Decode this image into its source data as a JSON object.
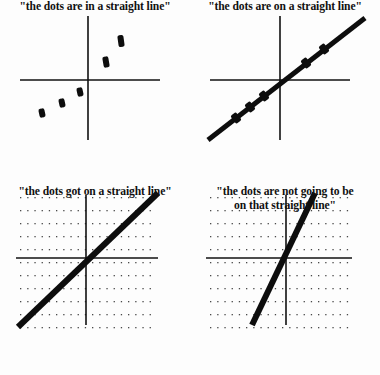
{
  "meme": {
    "title": "the dots are in a straight line",
    "background_color": "#fdfdfd",
    "ink_color": "#111111",
    "panel_count": 4
  },
  "panels": [
    {
      "id": "panel-1",
      "caption": "\"the dots are in a straight line\"",
      "grid": false,
      "trend_line": false,
      "axis": {
        "x_from": 20,
        "x_to": 160,
        "y_from": 16,
        "y_to": 140,
        "origin_x": 88,
        "origin_y": 80
      },
      "dots": [
        {
          "x": 42,
          "y": 113,
          "w": 6,
          "h": 9,
          "rot": -12
        },
        {
          "x": 62,
          "y": 103,
          "w": 6,
          "h": 9,
          "rot": -12
        },
        {
          "x": 80,
          "y": 92,
          "w": 6,
          "h": 9,
          "rot": -12
        },
        {
          "x": 106,
          "y": 62,
          "w": 6,
          "h": 11,
          "rot": -10
        },
        {
          "x": 121,
          "y": 41,
          "w": 6,
          "h": 12,
          "rot": -8
        }
      ]
    },
    {
      "id": "panel-2",
      "caption": "\"the dots are on a straight line\"",
      "grid": false,
      "trend_line": true,
      "axis": {
        "x_from": 20,
        "x_to": 160,
        "y_from": 16,
        "y_to": 140,
        "origin_x": 90,
        "origin_y": 80
      },
      "line": {
        "x1": 18,
        "y1": 140,
        "x2": 175,
        "y2": 18,
        "width": 5
      },
      "dots": [
        {
          "x": 46,
          "y": 118,
          "w": 7,
          "h": 10,
          "rot": -38
        },
        {
          "x": 60,
          "y": 107,
          "w": 7,
          "h": 10,
          "rot": -38
        },
        {
          "x": 74,
          "y": 96,
          "w": 7,
          "h": 10,
          "rot": -38
        },
        {
          "x": 116,
          "y": 63,
          "w": 7,
          "h": 10,
          "rot": -38
        },
        {
          "x": 134,
          "y": 49,
          "w": 7,
          "h": 10,
          "rot": -38
        }
      ]
    },
    {
      "id": "panel-3",
      "caption": "\"the dots got on a straight line\"",
      "grid": true,
      "trend_line": true,
      "axis": {
        "x_from": 16,
        "x_to": 158,
        "y_from": 10,
        "y_to": 140,
        "origin_x": 86,
        "origin_y": 73
      },
      "line": {
        "x1": 18,
        "y1": 142,
        "x2": 158,
        "y2": 8,
        "width": 6
      },
      "grid_spec": {
        "x_start": 20,
        "x_end": 156,
        "x_step": 7.2,
        "y_start": 12,
        "y_end": 142,
        "y_step": 13,
        "dot_size": 1.3
      },
      "dots": []
    },
    {
      "id": "panel-4",
      "caption": "\"the dots are not going to be\non that straight line\"",
      "grid": true,
      "trend_line": true,
      "axis": {
        "x_from": 16,
        "x_to": 162,
        "y_from": 10,
        "y_to": 140,
        "origin_x": 96,
        "origin_y": 73
      },
      "line": {
        "x1": 62,
        "y1": 140,
        "x2": 125,
        "y2": 8,
        "width": 6
      },
      "grid_spec": {
        "x_start": 20,
        "x_end": 160,
        "x_step": 7.2,
        "y_start": 12,
        "y_end": 142,
        "y_step": 13,
        "dot_size": 1.3
      },
      "dots": []
    }
  ]
}
